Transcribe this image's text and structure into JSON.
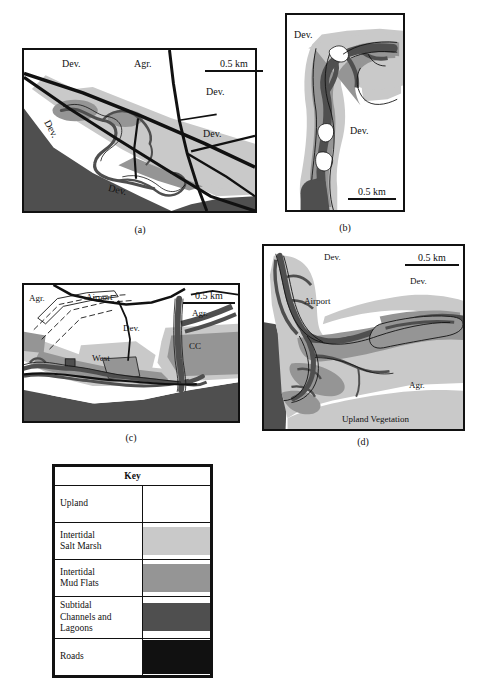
{
  "figure": {
    "background": "#ffffff"
  },
  "colors": {
    "upland": "#ffffff",
    "intertidal_salt_marsh": "#c9c9c9",
    "intertidal_mud_flats": "#959595",
    "subtidal_channels_lagoons": "#4f4f4f",
    "roads": "#111111",
    "outline": "#111111"
  },
  "panels": [
    {
      "id": "a",
      "caption": "(a)",
      "scalebar": {
        "label": "0.5 km"
      },
      "labels": [
        {
          "text": "Dev.",
          "x": 62,
          "y": 62
        },
        {
          "text": "Agr.",
          "x": 134,
          "y": 62
        },
        {
          "text": "Dev.",
          "x": 206,
          "y": 88
        },
        {
          "text": "Dev.",
          "x": 203,
          "y": 131
        },
        {
          "text": "Dev.",
          "x": 57,
          "y": 123,
          "rotated": true
        },
        {
          "text": "Dev.",
          "x": 113,
          "y": 185,
          "rotated": true
        }
      ]
    },
    {
      "id": "b",
      "caption": "(b)",
      "scalebar": {
        "label": "0.5 km"
      },
      "labels": [
        {
          "text": "Dev.",
          "x": 296,
          "y": 33
        },
        {
          "text": "Dev.",
          "x": 352,
          "y": 129
        }
      ]
    },
    {
      "id": "c",
      "caption": "(c)",
      "scalebar": {
        "label": "0.5 km"
      },
      "labels": [
        {
          "text": "Agr.",
          "x": 29,
          "y": 297
        },
        {
          "text": "Airport",
          "x": 87,
          "y": 296
        },
        {
          "text": "Agr.",
          "x": 192,
          "y": 312
        },
        {
          "text": "Dev.",
          "x": 124,
          "y": 327
        },
        {
          "text": "CC",
          "x": 190,
          "y": 345
        },
        {
          "text": "West",
          "x": 93,
          "y": 357
        }
      ]
    },
    {
      "id": "d",
      "caption": "(d)",
      "scalebar": {
        "label": "0.5 km"
      },
      "labels": [
        {
          "text": "Dev.",
          "x": 325,
          "y": 256
        },
        {
          "text": "Dev.",
          "x": 412,
          "y": 280
        },
        {
          "text": "Airport",
          "x": 306,
          "y": 300
        },
        {
          "text": "Agr.",
          "x": 410,
          "y": 384
        },
        {
          "text": "Upland Vegetation",
          "x": 345,
          "y": 418
        }
      ]
    }
  ],
  "key": {
    "title": "Key",
    "rows": [
      {
        "label": "Upland",
        "color": "#ffffff"
      },
      {
        "label": "Intertidal\nSalt Marsh",
        "line1": "Intertidal",
        "line2": "Salt Marsh",
        "color": "#c9c9c9"
      },
      {
        "label": "Intertidal\nMud Flats",
        "line1": "Intertidal",
        "line2": "Mud Flats",
        "color": "#959595"
      },
      {
        "label": "Subtidal\nChannels and\nLagoons",
        "line1": "Subtidal",
        "line2": "Channels and",
        "line3": "Lagoons",
        "color": "#4f4f4f"
      },
      {
        "label": "Roads",
        "color": "#111111"
      }
    ]
  }
}
